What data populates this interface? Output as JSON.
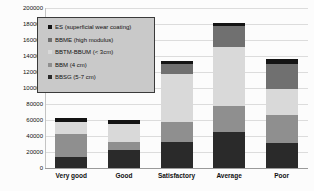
{
  "chart_data": {
    "type": "bar",
    "stacked": true,
    "title": "",
    "xlabel": "",
    "ylabel": "",
    "categories": [
      "Very good",
      "Good",
      "Satisfactory",
      "Average",
      "Poor"
    ],
    "series": [
      {
        "name": "BBSG (5-7 cm)",
        "color": "#2a2a2a",
        "values": [
          14000,
          22000,
          33000,
          45000,
          31000
        ]
      },
      {
        "name": "BBM (4 cm)",
        "color": "#8f8f8f",
        "values": [
          29000,
          11000,
          24000,
          33000,
          35000
        ]
      },
      {
        "name": "BBTM-BBUM (< 3cm)",
        "color": "#d9d9d9",
        "values": [
          15000,
          22000,
          61000,
          73000,
          33000
        ]
      },
      {
        "name": "BBME (high modulus)",
        "color": "#707070",
        "values": [
          0,
          0,
          12000,
          26000,
          31000
        ]
      },
      {
        "name": "ES (superficial wear coating)",
        "color": "#141414",
        "values": [
          4000,
          5000,
          4000,
          4000,
          6000
        ]
      }
    ],
    "legend_order": [
      "ES (superficial wear coating)",
      "BBME (high modulus)",
      "BBTM-BBUM (< 3cm)",
      "BBM (4 cm)",
      "BBSG (5-7 cm)"
    ],
    "ylim": [
      0,
      200000
    ],
    "ytick_step": 20000,
    "ytick_labels": [
      "200000",
      "180000",
      "160000",
      "140000",
      "120000",
      "100000",
      "80000",
      "60000",
      "40000",
      "20000",
      "0"
    ],
    "grid": true,
    "legend_position": "top-left",
    "colors": {
      "background": "#fcfcfc",
      "gridline": "#dcdcdc",
      "legend_background": "#c9c9c9",
      "legend_border": "#3a3a3a",
      "text": "#111111"
    }
  }
}
